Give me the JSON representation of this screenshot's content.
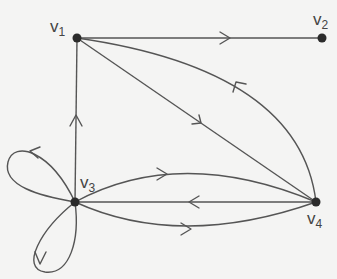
{
  "graph": {
    "type": "directed multigraph with loops",
    "vertices": [
      {
        "id": "v1",
        "label": "v",
        "sub": "1",
        "x": 77,
        "y": 38
      },
      {
        "id": "v2",
        "label": "v",
        "sub": "2",
        "x": 322,
        "y": 38
      },
      {
        "id": "v3",
        "label": "v",
        "sub": "3",
        "x": 75,
        "y": 202
      },
      {
        "id": "v4",
        "label": "v",
        "sub": "4",
        "x": 316,
        "y": 202
      }
    ],
    "edges": [
      {
        "from": "v1",
        "to": "v2",
        "shape": "straight"
      },
      {
        "from": "v1",
        "to": "v4",
        "shape": "straight"
      },
      {
        "from": "v4",
        "to": "v1",
        "shape": "curved"
      },
      {
        "from": "v3",
        "to": "v1",
        "shape": "straight"
      },
      {
        "from": "v3",
        "to": "v4",
        "shape": "curved-upper"
      },
      {
        "from": "v4",
        "to": "v3",
        "shape": "straight"
      },
      {
        "from": "v3",
        "to": "v4",
        "shape": "curved-lower"
      },
      {
        "from": "v3",
        "to": "v3",
        "shape": "loop-upper-left"
      },
      {
        "from": "v3",
        "to": "v3",
        "shape": "loop-lower"
      }
    ],
    "colors": {
      "edge": "#555555",
      "node": "#2b2b2b",
      "background": "#f4f4f3"
    }
  }
}
